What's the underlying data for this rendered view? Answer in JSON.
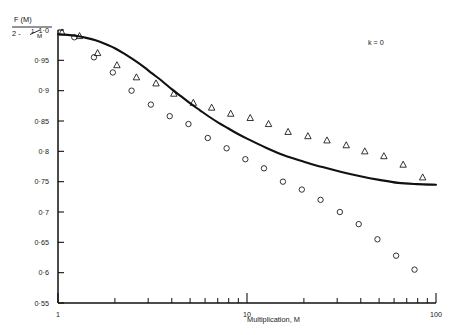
{
  "figure": {
    "annotation": "k = 0",
    "y_axis_label_numerator": "F (M)",
    "y_axis_label_denominator_prefix": "2 -",
    "y_axis_label_denominator_frac_num": "1",
    "y_axis_label_denominator_frac_den": "M",
    "x_axis_title": "Multiplication,  M"
  },
  "chart_data": {
    "type": "scatter",
    "title": "",
    "xlabel": "Multiplication, M",
    "ylabel": "F(M) / (2 - 1/M)",
    "annotation": "k = 0",
    "xscale": "log",
    "xlim": [
      1,
      100
    ],
    "ylim": [
      0.55,
      1.0
    ],
    "grid": false,
    "legend": "none",
    "xticks_major": [
      1,
      10,
      100
    ],
    "xtick_labels": [
      "1",
      "10",
      "100"
    ],
    "xticks_minor": [
      2,
      3,
      4,
      5,
      6,
      7,
      8,
      9,
      20,
      30,
      40,
      50,
      60,
      70,
      80,
      90
    ],
    "yticks": [
      0.55,
      0.6,
      0.65,
      0.7,
      0.75,
      0.8,
      0.85,
      0.9,
      0.95,
      1.0
    ],
    "ytick_labels": [
      "0·55",
      "0·6",
      "0·65",
      "0·7",
      "0·75",
      "0·8",
      "0·85",
      "0·9",
      "0·95",
      "1·0"
    ],
    "series": [
      {
        "name": "theoretical-curve",
        "type": "line",
        "marker": "none",
        "x": [
          1.0,
          1.12,
          1.26,
          1.41,
          1.58,
          1.78,
          2.0,
          2.24,
          2.51,
          2.82,
          3.16,
          3.55,
          3.98,
          4.47,
          5.01,
          5.62,
          6.31,
          7.08,
          7.94,
          8.91,
          10.0,
          12.6,
          15.8,
          20.0,
          25.1,
          31.6,
          39.8,
          50.1,
          63.1,
          79.4,
          100.0
        ],
        "y": [
          0.993,
          0.992,
          0.99,
          0.987,
          0.983,
          0.977,
          0.97,
          0.961,
          0.951,
          0.94,
          0.928,
          0.916,
          0.903,
          0.891,
          0.879,
          0.868,
          0.857,
          0.847,
          0.838,
          0.829,
          0.821,
          0.806,
          0.793,
          0.783,
          0.774,
          0.766,
          0.759,
          0.753,
          0.748,
          0.746,
          0.745
        ]
      },
      {
        "name": "triangles",
        "type": "scatter",
        "marker": "triangle",
        "x": [
          1.05,
          1.3,
          1.62,
          2.05,
          2.6,
          3.3,
          4.1,
          5.2,
          6.5,
          8.2,
          10.4,
          13.0,
          16.5,
          21.0,
          26.5,
          33.5,
          42.0,
          53.0,
          67.0,
          85.0
        ],
        "y": [
          0.996,
          0.99,
          0.962,
          0.942,
          0.922,
          0.912,
          0.895,
          0.88,
          0.872,
          0.862,
          0.855,
          0.845,
          0.832,
          0.825,
          0.818,
          0.81,
          0.8,
          0.792,
          0.778,
          0.757
        ]
      },
      {
        "name": "circles",
        "type": "scatter",
        "marker": "circle",
        "x": [
          1.22,
          1.55,
          1.95,
          2.45,
          3.1,
          3.9,
          4.9,
          6.2,
          7.8,
          9.8,
          12.3,
          15.5,
          19.5,
          24.5,
          31.0,
          39.0,
          49.0,
          61.5,
          77.0
        ],
        "y": [
          0.988,
          0.955,
          0.93,
          0.9,
          0.877,
          0.858,
          0.845,
          0.822,
          0.805,
          0.787,
          0.772,
          0.75,
          0.737,
          0.72,
          0.7,
          0.68,
          0.655,
          0.628,
          0.605
        ]
      }
    ]
  }
}
